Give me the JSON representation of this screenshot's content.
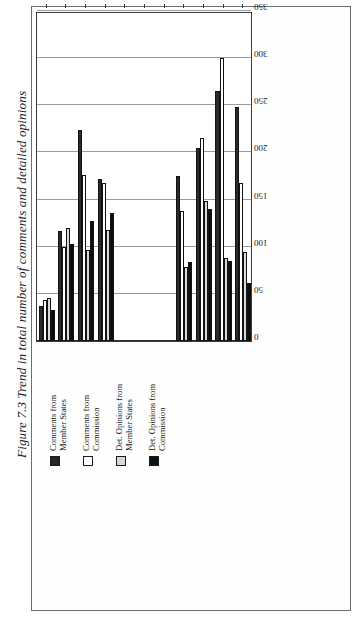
{
  "figure": {
    "caption": "Figure 7.3 Trend in total number of comments and detailed opinions"
  },
  "legend": {
    "items": [
      {
        "label": "Comments from\nMember States",
        "swatch": "dark"
      },
      {
        "label": "Comments from\nCommission",
        "swatch": "white"
      },
      {
        "label": "Det. Opinions from\nMember States",
        "swatch": "gray"
      },
      {
        "label": "Det. Opinions from\nCommission",
        "swatch": "black"
      }
    ]
  },
  "chart_data": {
    "type": "bar",
    "orientation": "horizontal",
    "title": "Figure 7.3 Trend in total number of comments and detailed opinions",
    "xlabel": "",
    "ylabel": "",
    "xlim": [
      0,
      350
    ],
    "ticks": [
      0,
      50,
      100,
      150,
      200,
      250,
      300,
      350
    ],
    "grid": true,
    "legend_position": "top-left",
    "categories": [
      "1988",
      "1989",
      "1990",
      "1991",
      "1992",
      "1993",
      "1994",
      "1995",
      "1996",
      "1997",
      "1998"
    ],
    "series": [
      {
        "name": "Comments from Member States",
        "swatch": "dark",
        "values": [
          37,
          117,
          224,
          172,
          0,
          0,
          0,
          175,
          205,
          265,
          248
        ]
      },
      {
        "name": "Comments from Commission",
        "swatch": "white",
        "values": [
          43,
          100,
          176,
          168,
          0,
          0,
          0,
          138,
          215,
          300,
          168
        ]
      },
      {
        "name": "Det. Opinions from Member States",
        "swatch": "gray",
        "values": [
          46,
          120,
          97,
          118,
          0,
          0,
          0,
          78,
          148,
          88,
          94
        ]
      },
      {
        "name": "Det. Opinions from Commission",
        "swatch": "black",
        "values": [
          33,
          103,
          127,
          136,
          0,
          0,
          0,
          84,
          140,
          85,
          62
        ]
      }
    ]
  }
}
